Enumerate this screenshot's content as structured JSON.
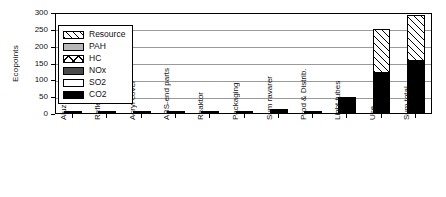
{
  "chart_data": {
    "type": "bar",
    "title": "",
    "xlabel": "",
    "ylabel": "Ecopoints",
    "ylim": [
      0,
      300
    ],
    "yticks": [
      0,
      50,
      100,
      150,
      200,
      250,
      300
    ],
    "grid": true,
    "stacked": true,
    "legend_position": "upper-left-inside",
    "categories": [
      "Aluzink",
      "Reflektor",
      "Acryl cover",
      "ABS-end parts",
      "Reaktor",
      "Packaging",
      "Sum ravarer",
      "Prod & Distrib.",
      "Light tubes",
      "Use",
      "Sum total"
    ],
    "series": [
      {
        "name": "CO2",
        "pattern": "solid-black",
        "color": "#000000",
        "values": [
          2,
          2,
          1,
          1,
          1,
          1,
          1,
          1,
          47,
          120,
          155
        ]
      },
      {
        "name": "SO2",
        "pattern": "solid-white",
        "color": "#ffffff",
        "values": [
          0,
          0,
          0,
          0,
          0,
          0,
          0,
          0,
          0,
          0,
          0
        ]
      },
      {
        "name": "NOx",
        "pattern": "solid-dark-gray",
        "color": "#4a4a4a",
        "values": [
          0,
          0,
          0,
          0,
          0,
          0,
          0,
          0,
          0,
          0,
          0
        ]
      },
      {
        "name": "HC",
        "pattern": "cross-hatch",
        "color": "#ffffff",
        "values": [
          0,
          0,
          0,
          0,
          0,
          0,
          0,
          0,
          0,
          0,
          0
        ]
      },
      {
        "name": "PAH",
        "pattern": "solid-light-gray",
        "color": "#b8b8b8",
        "values": [
          0,
          0,
          0,
          0,
          0,
          0,
          4,
          0,
          0,
          0,
          0
        ]
      },
      {
        "name": "Resource",
        "pattern": "diagonal-hatch",
        "color": "#ffffff",
        "values": [
          0,
          0,
          0,
          0,
          0,
          0,
          0,
          0,
          0,
          130,
          135
        ]
      }
    ],
    "totals": [
      2,
      2,
      1,
      1,
      1,
      1,
      5,
      1,
      47,
      250,
      290
    ]
  },
  "legend": {
    "items": [
      {
        "label": "Resource",
        "key": "res"
      },
      {
        "label": "PAH",
        "key": "pah"
      },
      {
        "label": "HC",
        "key": "hc"
      },
      {
        "label": "NOx",
        "key": "nox"
      },
      {
        "label": "SO2",
        "key": "so2"
      },
      {
        "label": "CO2",
        "key": "co2"
      }
    ]
  }
}
